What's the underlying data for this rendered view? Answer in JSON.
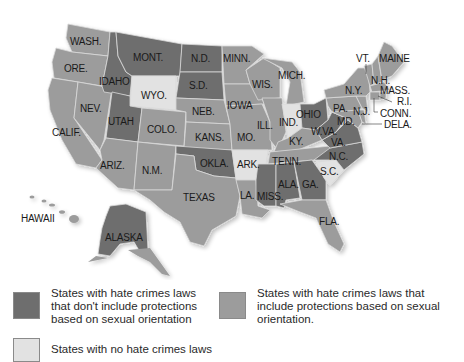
{
  "colors": {
    "no_orientation": "#6e6e6e",
    "with_orientation": "#9c9c9c",
    "no_law": "#e2e2e2",
    "state_border": "#d9d9d9",
    "label": "#1a1a1a"
  },
  "map": {
    "states": {
      "wash": "WASH.",
      "ore": "ORE.",
      "calif": "CALIF.",
      "nev": "NEV.",
      "idaho": "IDAHO",
      "mont": "MONT.",
      "wyo": "WYO.",
      "utah": "UTAH",
      "colo": "COLO.",
      "ariz": "ARIZ.",
      "nm": "N.M.",
      "nd": "N.D.",
      "sd": "S.D.",
      "neb": "NEB.",
      "kans": "KANS.",
      "okla": "OKLA.",
      "texas": "TEXAS",
      "minn": "MINN.",
      "iowa": "IOWA",
      "mo": "MO.",
      "ark": "ARK.",
      "la": "LA.",
      "wis": "WIS.",
      "ill": "ILL.",
      "mich": "MICH.",
      "ind": "IND.",
      "ohio": "OHIO",
      "ky": "KY.",
      "tenn": "TENN.",
      "miss": "MISS.",
      "ala": "ALA.",
      "ga": "GA.",
      "fla": "FLA.",
      "sc": "S.C.",
      "nc": "N.C.",
      "va": "VA.",
      "wva": "W.VA.",
      "md": "MD.",
      "dela": "DELA.",
      "pa": "PA.",
      "nj": "N.J.",
      "ny": "N.Y.",
      "conn": "CONN.",
      "ri": "R.I.",
      "mass": "MASS.",
      "vt": "VT.",
      "nh": "N.H.",
      "maine": "MAINE",
      "hawaii": "HAWAII",
      "alaska": "ALASKA"
    },
    "categories": {
      "no_orientation": [
        "IDAHO",
        "MONT.",
        "UTAH",
        "N.D.",
        "S.D.",
        "OKLA.",
        "OHIO",
        "W.VA.",
        "VA.",
        "N.C.",
        "ALA.",
        "GA.",
        "MISS.",
        "ALASKA"
      ],
      "with_orientation": [
        "WASH.",
        "ORE.",
        "CALIF.",
        "NEV.",
        "COLO.",
        "ARIZ.",
        "N.M.",
        "NEB.",
        "KANS.",
        "TEXAS",
        "MINN.",
        "IOWA",
        "MO.",
        "LA.",
        "WIS.",
        "ILL.",
        "MICH.",
        "KY.",
        "TENN.",
        "FLA.",
        "MD.",
        "DELA.",
        "PA.",
        "N.J.",
        "N.Y.",
        "CONN.",
        "R.I.",
        "MASS.",
        "VT.",
        "N.H.",
        "MAINE",
        "HAWAII"
      ],
      "no_law": [
        "WYO.",
        "ARK.",
        "IND.",
        "S.C."
      ]
    }
  },
  "legend": {
    "items": [
      {
        "key": "no_orientation",
        "lines": [
          "States with hate crimes laws",
          "that don't include protections",
          "based on sexual orientation"
        ]
      },
      {
        "key": "with_orientation",
        "lines": [
          "States with hate crimes laws that",
          "include protections based on sexual",
          "orientation."
        ]
      },
      {
        "key": "no_law",
        "lines": [
          "States with no hate crimes laws"
        ]
      }
    ]
  }
}
